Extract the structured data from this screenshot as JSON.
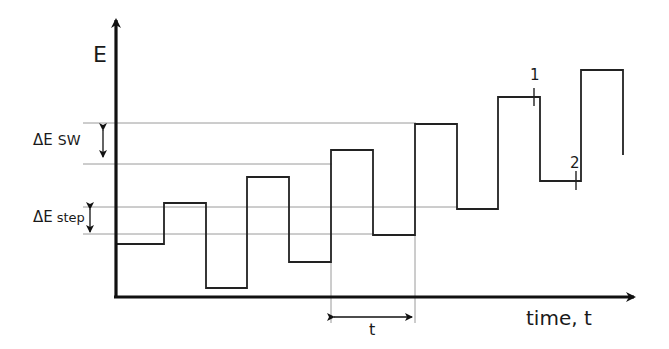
{
  "diagram": {
    "type": "square-wave staircase potential waveform",
    "y_axis_label": "E",
    "x_axis_label": "time, t",
    "annotations": {
      "delta_e_sw": {
        "symbol": "ΔE",
        "sub": "SW"
      },
      "delta_e_step": {
        "symbol": "ΔE",
        "sub": "step"
      },
      "period": "t",
      "marker_1": "1",
      "marker_2": "2"
    },
    "colors": {
      "axis": "#111111",
      "waveform": "#222222",
      "guide_lines": "#9a9a9a"
    },
    "waveform_levels_px": [
      244,
      203,
      288,
      177,
      262,
      150,
      235,
      124,
      209,
      97,
      181,
      70,
      155
    ],
    "guide_lines_y_px": [
      123,
      164,
      207,
      234
    ]
  }
}
